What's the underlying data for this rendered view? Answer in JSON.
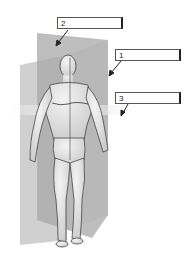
{
  "figure": {
    "labels": [
      {
        "id": "1",
        "text": "1",
        "target": "sagittal-plane"
      },
      {
        "id": "2",
        "text": "2",
        "target": "frontal-plane"
      },
      {
        "id": "3",
        "text": "3",
        "target": "transverse-plane"
      }
    ]
  },
  "colors": {
    "plane_light": "#bdbdbd",
    "plane_dark": "#9a9a9a",
    "skin": "#e6e6e6",
    "outline": "#333333",
    "arrow": "#222222"
  }
}
